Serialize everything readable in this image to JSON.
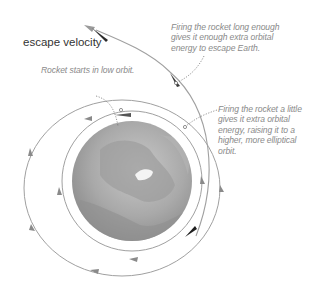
{
  "diagram": {
    "title": "escape velocity",
    "annotations": {
      "low_orbit": {
        "lines": [
          "Rocket starts in low orbit."
        ]
      },
      "escape": {
        "lines": [
          "Firing the rocket long enough",
          "gives it enough extra orbital",
          "energy to escape Earth."
        ]
      },
      "elliptical": {
        "lines": [
          "Firing the rocket a little",
          "gives it extra orbital",
          "energy, raising it to a",
          "higher, more elliptical",
          "orbit."
        ]
      }
    },
    "elements": {
      "earth": "earth-globe",
      "inner_orbit": "low circular orbit",
      "middle_orbit": "elliptical orbit",
      "escape_path": "escape trajectory"
    },
    "colors": {
      "orbit_line": "#9a9a9a",
      "earth_dark": "#8e8e8e",
      "earth_light": "#c8c8c8",
      "rocket": "#2a2a2a",
      "arrow_accent": "#7a7a7a",
      "text_title": "#333333",
      "text_annotation": "#8a8a8a"
    }
  }
}
